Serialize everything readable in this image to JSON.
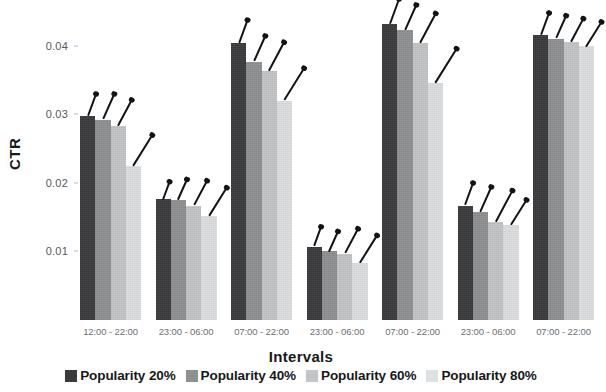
{
  "chart_data": {
    "type": "bar",
    "title": "",
    "xlabel": "Intervals",
    "ylabel": "CTR",
    "ylim": [
      0,
      0.0455
    ],
    "yticks": [
      0.01,
      0.02,
      0.03,
      0.04
    ],
    "ytick_labels": [
      "0.01",
      "0.02",
      "0.03",
      "0.04"
    ],
    "grid": false,
    "legend_position": "bottom",
    "categories": [
      "12:00 - 22:00",
      "23:00 - 06:00",
      "07:00 - 22:00",
      "23:00 - 06:00",
      "07:00 - 22:00",
      "23:00 - 06:00",
      "07:00 - 22:00"
    ],
    "series": [
      {
        "name": "Popularity 20%",
        "color": "#3b3b3d",
        "values": [
          0.0298,
          0.0176,
          0.0404,
          0.0107,
          0.0432,
          0.0167,
          0.0415
        ],
        "errors": [
          0.0016,
          0.0013,
          0.0017,
          0.0014,
          0.0018,
          0.0016,
          0.0016
        ]
      },
      {
        "name": "Popularity 40%",
        "color": "#8e9092",
        "values": [
          0.0292,
          0.0175,
          0.0377,
          0.01,
          0.0423,
          0.0157,
          0.041
        ],
        "errors": [
          0.0019,
          0.0015,
          0.0019,
          0.0015,
          0.0019,
          0.0019,
          0.0017
        ]
      },
      {
        "name": "Popularity 60%",
        "color": "#c3c5c7",
        "values": [
          0.0283,
          0.0167,
          0.0363,
          0.0097,
          0.0404,
          0.0143,
          0.0405
        ],
        "errors": [
          0.002,
          0.0019,
          0.0022,
          0.0019,
          0.0023,
          0.0024,
          0.0018
        ]
      },
      {
        "name": "Popularity 80%",
        "color": "#dddfe0",
        "values": [
          0.0225,
          0.0152,
          0.032,
          0.0083,
          0.0345,
          0.0139,
          0.0399
        ],
        "errors": [
          0.0025,
          0.0023,
          0.0026,
          0.0022,
          0.0028,
          0.002,
          0.002
        ]
      }
    ]
  },
  "axis": {
    "y_title": "CTR",
    "x_title": "Intervals"
  },
  "legend": {
    "items": [
      {
        "label": "Popularity 20%",
        "swatch": "s0"
      },
      {
        "label": "Popularity 40%",
        "swatch": "s1"
      },
      {
        "label": "Popularity 60%",
        "swatch": "s2"
      },
      {
        "label": "Popularity 80%",
        "swatch": "s3"
      }
    ]
  }
}
